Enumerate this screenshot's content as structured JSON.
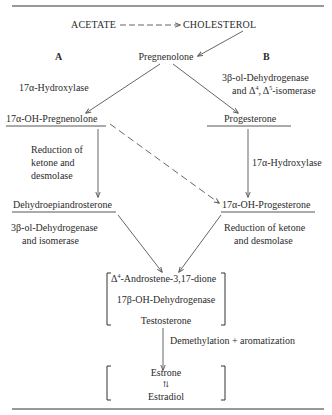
{
  "diagram": {
    "type": "biosynthetic pathway",
    "top": {
      "source": "ACETATE",
      "target": "CHOLESTEROL",
      "arrow_style": "dashed"
    },
    "start_node": "Pregnenolone",
    "pathway_labels": {
      "left": "A",
      "right": "B"
    },
    "pathway_a": {
      "step1_enzyme": "17α-Hydroxylase",
      "node1": "17α-OH-Pregnenolone",
      "step2_enzyme_lines": [
        "Reduction of",
        "ketone and",
        "desmolase"
      ],
      "node2": "Dehydroepiandrosterone",
      "step3_enzyme_lines": [
        "3β-ol-Dehydrogenase",
        "and isomerase"
      ]
    },
    "pathway_b": {
      "step1_enzyme_lines": [
        "3β-ol-Dehydrogenase",
        "and Δ",
        "4",
        ", Δ",
        "5",
        "-isomerase"
      ],
      "node1": "Progesterone",
      "step2_enzyme": "17α-Hydroxylase",
      "node2": "17α-OH-Progesterone",
      "step3_enzyme_lines": [
        "Reduction of ketone",
        "and desmolase"
      ]
    },
    "convergence": {
      "node_prefix": "Δ",
      "node_sup": "4",
      "node_suffix": "-Androstene-3,17-dione",
      "enzyme": "17β-OH-Dehydrogenase",
      "product": "Testosterone"
    },
    "final_step": {
      "enzyme": "Demethylation + aromatization",
      "product_top": "Estrone",
      "equilibrium_symbol": "⇅",
      "product_bottom": "Estradiol"
    },
    "colors": {
      "ink": "#2b2b2b",
      "line": "#555555",
      "rule": "#333333",
      "background": "#ffffff"
    }
  }
}
